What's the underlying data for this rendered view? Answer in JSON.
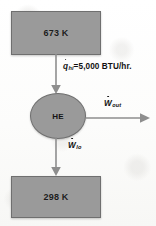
{
  "diagram": {
    "hot_reservoir": {
      "name": "hot-reservoir",
      "temperature": "673 K"
    },
    "cold_reservoir": {
      "name": "cold-reservoir",
      "temperature": "298 K"
    },
    "engine": {
      "name": "heat-engine",
      "label": "HE"
    },
    "flows": [
      {
        "id": "q-hi",
        "symbol": "q",
        "subscript": "hi",
        "dot": true,
        "equals": "=",
        "value": "5,000",
        "unit": "BTU/hr.",
        "text": "q̇hi=5,000 BTU/hr.",
        "direction": "down",
        "from": "hot-reservoir",
        "to": "heat-engine"
      },
      {
        "id": "w-out",
        "symbol": "W",
        "subscript": "out",
        "dot": true,
        "equals": "",
        "value": "",
        "unit": "",
        "text": "Ẇout",
        "direction": "right",
        "from": "heat-engine",
        "to": "surroundings"
      },
      {
        "id": "w-lo",
        "symbol": "W",
        "subscript": "lo",
        "dot": true,
        "equals": "",
        "value": "",
        "unit": "",
        "text": "Ẇlo",
        "direction": "down",
        "from": "heat-engine",
        "to": "cold-reservoir"
      }
    ],
    "colors": {
      "shape_fill": "#9a9a9a",
      "shape_stroke": "#6f6f6f",
      "arrow": "#8e8e8e",
      "text": "#111111",
      "background": "#fdfdfc"
    }
  }
}
